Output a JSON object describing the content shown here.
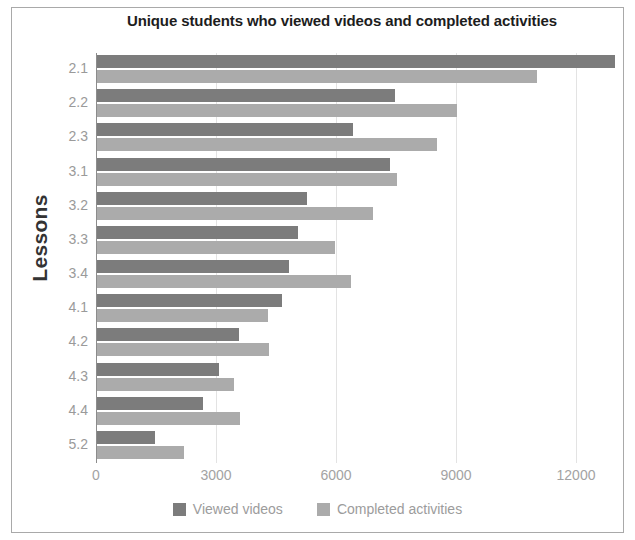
{
  "chart_data": {
    "type": "bar",
    "orientation": "horizontal",
    "title": "Unique students who viewed videos and completed activities",
    "xlabel": "",
    "ylabel": "Lessons",
    "categories": [
      "2.1",
      "2.2",
      "2.3",
      "3.1",
      "3.2",
      "3.3",
      "3.4",
      "4.1",
      "4.2",
      "4.3",
      "4.4",
      "5.2"
    ],
    "series": [
      {
        "name": "Viewed videos",
        "color": "#7c7c7c",
        "values": [
          12950,
          7450,
          6400,
          7325,
          5250,
          5025,
          4800,
          4625,
          3550,
          3050,
          2650,
          1450
        ]
      },
      {
        "name": "Completed activities",
        "color": "#ababab",
        "values": [
          11000,
          9000,
          8500,
          7500,
          6900,
          5950,
          6350,
          4275,
          4300,
          3425,
          3575,
          2175
        ]
      }
    ],
    "xticks": [
      0,
      3000,
      6000,
      9000,
      12000
    ],
    "xtick_labels": [
      "0",
      "3000",
      "6000",
      "9000",
      "12000"
    ],
    "xlim": [
      0,
      13250
    ],
    "grid": true,
    "legend_position": "bottom"
  },
  "legend": {
    "items": [
      {
        "label": "Viewed videos",
        "color": "#7c7c7c"
      },
      {
        "label": "Completed activities",
        "color": "#ababab"
      }
    ]
  }
}
